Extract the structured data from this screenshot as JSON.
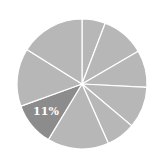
{
  "chart_data": {
    "type": "pie",
    "title": "",
    "start_angle_deg": 0,
    "direction": "clockwise",
    "slices": [
      {
        "label": "",
        "value": 5.8,
        "color": "#b7b7b7"
      },
      {
        "label": "",
        "value": 10.8,
        "color": "#b7b7b7"
      },
      {
        "label": "",
        "value": 9.2,
        "color": "#b7b7b7"
      },
      {
        "label": "",
        "value": 10.3,
        "color": "#b7b7b7"
      },
      {
        "label": "",
        "value": 7.2,
        "color": "#b7b7b7"
      },
      {
        "label": "",
        "value": 15.3,
        "color": "#b7b7b7"
      },
      {
        "label": "11%",
        "value": 10.8,
        "color": "#8c8c8c",
        "highlighted": true
      },
      {
        "label": "",
        "value": 14.4,
        "color": "#b7b7b7"
      },
      {
        "label": "",
        "value": 16.1,
        "color": "#b7b7b7"
      }
    ],
    "values": [
      5.8,
      10.8,
      9.2,
      10.3,
      7.2,
      15.3,
      10.8,
      14.4,
      16.1
    ],
    "legend": null,
    "annotations": [
      {
        "text": "11%",
        "slice_index": 6
      }
    ]
  },
  "colors": {
    "background": "#ffffff",
    "slice_default": "#b7b7b7",
    "slice_highlight": "#8c8c8c",
    "divider": "#ffffff",
    "label": "#ffffff"
  },
  "geometry": {
    "cx": 82,
    "cy": 84,
    "r": 65
  }
}
